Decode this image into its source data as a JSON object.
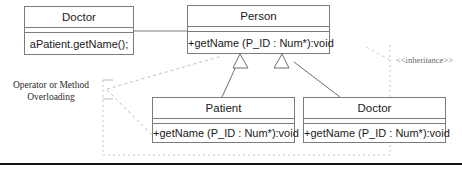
{
  "diagram": {
    "background_color": "#ffffff",
    "border_color": "#7c7c7c",
    "text_color": "#1a1a1a",
    "dashed_color": "#b4b4b4",
    "rule_color": "#111111",
    "classes": [
      {
        "id": "doctor-caller",
        "name": "Doctor",
        "member": "aPatient.getName();",
        "x": 24,
        "y": 6,
        "width": 110,
        "height": 49
      },
      {
        "id": "person",
        "name": "Person",
        "member": "+getName (P_ID : Num*):void",
        "x": 187,
        "y": 5,
        "width": 143,
        "height": 49
      },
      {
        "id": "patient",
        "name": "Patient",
        "member": "+getName (P_ID : Num*):void",
        "x": 152,
        "y": 97,
        "width": 143,
        "height": 46
      },
      {
        "id": "doctor-sub",
        "name": "Doctor",
        "member": "+getName (P_ID : Num*):void",
        "x": 303,
        "y": 97,
        "width": 143,
        "height": 46
      }
    ],
    "labels": {
      "overloading_line1": "Operator or Method",
      "overloading_line2": "Overloading",
      "inheritance_stereotype": "<<inheritance>>"
    }
  }
}
